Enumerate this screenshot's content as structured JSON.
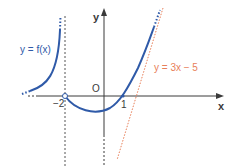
{
  "diagram": {
    "type": "function-graph",
    "axes": {
      "x_label": "x",
      "y_label": "y",
      "origin_label": "O",
      "x_ticks": [
        {
          "value": -2,
          "label": "−2"
        },
        {
          "value": 1,
          "label": "1"
        }
      ]
    },
    "curves": [
      {
        "name": "f",
        "label": "y = f(x)",
        "color": "#2f5aa8",
        "description": "function with vertical asymptote x = -2 on left branch; right branch passes through (1,0) with open circle at (-2,0)"
      },
      {
        "name": "oblique-asymptote",
        "label": "y = 3x − 5",
        "color": "#e8805a",
        "style": "dotted"
      }
    ],
    "asymptotes": [
      {
        "type": "vertical",
        "x": -2,
        "style": "dotted"
      },
      {
        "type": "oblique",
        "equation": "y = 3x - 5",
        "style": "dotted"
      }
    ],
    "points": [
      {
        "x": -2,
        "y": 0,
        "style": "open-circle"
      },
      {
        "x": 1,
        "y": 0,
        "style": "point"
      }
    ],
    "colors": {
      "axis": "#3a3a3a",
      "curve": "#2f5aa8",
      "line": "#e8805a",
      "asymptote": "#555555"
    }
  }
}
